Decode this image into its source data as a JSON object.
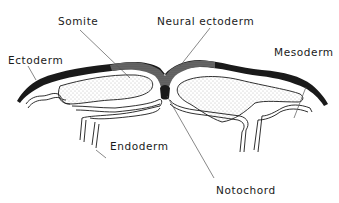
{
  "diagram": {
    "labels": {
      "somite": "Somite",
      "neural_ectoderm": "Neural ectoderm",
      "ectoderm": "Ectoderm",
      "mesoderm": "Mesoderm",
      "endoderm": "Endoderm",
      "notochord": "Notochord"
    },
    "colors": {
      "ink": "#1a1a1a",
      "background": "#ffffff",
      "stipple": "#777777"
    }
  }
}
